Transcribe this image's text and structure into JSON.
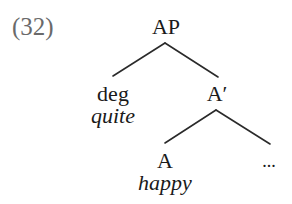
{
  "example_number": "(32)",
  "tree": {
    "nodes": [
      {
        "id": "AP",
        "label": "AP",
        "x": 166,
        "y": 16,
        "kind": "category"
      },
      {
        "id": "deg",
        "label": "deg",
        "x": 113,
        "y": 83,
        "kind": "category",
        "word": "quite",
        "word_y": 105
      },
      {
        "id": "Abar",
        "label": "A′",
        "x": 217,
        "y": 83,
        "kind": "category"
      },
      {
        "id": "A",
        "label": "A",
        "x": 165,
        "y": 150,
        "kind": "category",
        "word": "happy",
        "word_y": 172
      },
      {
        "id": "rest",
        "label": "...",
        "x": 269,
        "y": 152,
        "kind": "ellipsis"
      }
    ],
    "edges": [
      {
        "from": "AP",
        "to": "deg",
        "x1": 165,
        "y1": 43,
        "x2": 113,
        "y2": 76
      },
      {
        "from": "AP",
        "to": "Abar",
        "x1": 165,
        "y1": 43,
        "x2": 218,
        "y2": 77
      },
      {
        "from": "Abar",
        "to": "A",
        "x1": 216,
        "y1": 110,
        "x2": 165,
        "y2": 143
      },
      {
        "from": "Abar",
        "to": "rest",
        "x1": 216,
        "y1": 110,
        "x2": 270,
        "y2": 144
      }
    ]
  },
  "colors": {
    "line": "#2a2a2a",
    "text": "#1a1a1a",
    "example_number": "#6a6a6a",
    "background": "#ffffff"
  }
}
